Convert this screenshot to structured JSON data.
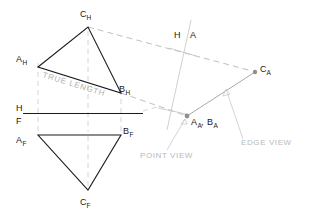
{
  "drawing": {
    "title": "Descriptive geometry: true length, edge view and point view of a plane",
    "canvas": {
      "width": 312,
      "height": 214
    },
    "colors": {
      "object_line": "#1a1a1a",
      "projection_line": "#b8b8b8",
      "auxiliary_line": "#a8a8a8",
      "annotation_text": "#b9b9b9",
      "label_text": "#1a1a1a",
      "background": "#ffffff"
    }
  },
  "views": {
    "top_view": {
      "name": "Horizontal (top) view",
      "vertices": [
        {
          "id": "A_H",
          "label_main": "A",
          "label_sub": "H",
          "x": 38,
          "y": 67,
          "label_x": 16,
          "label_y": 62
        },
        {
          "id": "C_H",
          "label_main": "C",
          "label_sub": "H",
          "x": 88,
          "y": 27,
          "label_x": 80,
          "label_y": 17
        },
        {
          "id": "B_H",
          "label_main": "B",
          "label_sub": "H",
          "x": 121,
          "y": 93,
          "label_x": 119,
          "label_y": 92
        }
      ],
      "annotation": {
        "text": "TRUE LENGTH",
        "x": 42,
        "y": 76,
        "rotation": 17.2
      }
    },
    "front_view": {
      "name": "Frontal (front) view",
      "vertices": [
        {
          "id": "A_F",
          "label_main": "A",
          "label_sub": "F",
          "x": 38,
          "y": 135,
          "label_x": 16,
          "label_y": 146
        },
        {
          "id": "B_F",
          "label_main": "B",
          "label_sub": "F",
          "x": 121,
          "y": 135,
          "label_x": 123,
          "label_y": 134
        },
        {
          "id": "C_F",
          "label_main": "C",
          "label_sub": "F",
          "x": 88,
          "y": 190,
          "label_x": 80,
          "label_y": 205
        }
      ]
    },
    "auxiliary_view": {
      "name": "Auxiliary (edge) view",
      "vertices": [
        {
          "id": "AA_BA",
          "label_main": "A",
          "label_sub": "A",
          "label_main2": "B",
          "label_sub2": "A",
          "x": 187,
          "y": 116,
          "label_x": 190,
          "label_y": 124
        },
        {
          "id": "C_A",
          "label_main": "C",
          "label_sub": "A",
          "x": 255,
          "y": 72,
          "label_x": 259,
          "label_y": 72
        }
      ],
      "annotations": [
        {
          "text": "POINT VIEW",
          "x": 140,
          "y": 157
        },
        {
          "text": "EDGE VIEW",
          "x": 240,
          "y": 145
        }
      ]
    }
  },
  "fold_lines": {
    "hf": {
      "name": "Horizontal / Frontal fold line",
      "label_top": "H",
      "label_bottom": "F",
      "label_x": 19,
      "label_top_y": 110,
      "label_bottom_y": 122,
      "x1": 23,
      "y1": 114,
      "x2": 143,
      "y2": 114
    },
    "ha": {
      "name": "Horizontal / Auxiliary fold line",
      "label_left": "H",
      "label_right": "A",
      "label_left_x": 175,
      "label_right_x": 190,
      "label_y": 36,
      "x1": 191,
      "y1": 20,
      "x2": 167,
      "y2": 130
    }
  },
  "projection_lines": [
    {
      "from": "C_H",
      "to": "C_A",
      "style": "dashed"
    },
    {
      "from": "B_H",
      "to": "AA_BA",
      "style": "dashed"
    },
    {
      "from": "A_H",
      "to": "A_F",
      "style": "dashed-vertical"
    },
    {
      "from": "B_H",
      "to": "B_F",
      "style": "dashed-vertical"
    },
    {
      "from": "C_H",
      "to": "C_F",
      "style": "dashed-vertical"
    }
  ]
}
